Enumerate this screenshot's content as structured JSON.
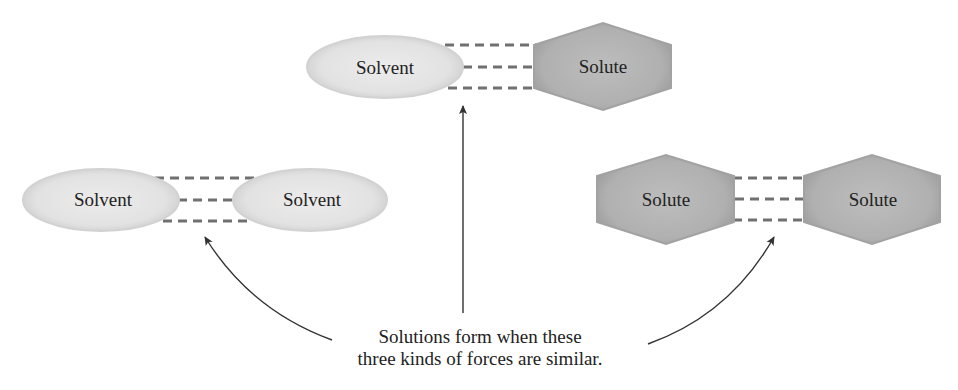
{
  "diagram": {
    "top_pair": {
      "left": {
        "shape": "ellipse",
        "label": "Solvent"
      },
      "right": {
        "shape": "hexagon",
        "label": "Solute"
      },
      "interaction": "dashed-lines x3"
    },
    "left_pair": {
      "left": {
        "shape": "ellipse",
        "label": "Solvent"
      },
      "right": {
        "shape": "ellipse",
        "label": "Solvent"
      },
      "interaction": "dashed-lines x3"
    },
    "right_pair": {
      "left": {
        "shape": "hexagon",
        "label": "Solute"
      },
      "right": {
        "shape": "hexagon",
        "label": "Solute"
      },
      "interaction": "dashed-lines x3"
    },
    "caption": {
      "line1": "Solutions form when these",
      "line2": "three kinds of forces are similar."
    },
    "arrows": [
      "caption-to-left-pair",
      "caption-to-top-pair",
      "caption-to-right-pair"
    ]
  },
  "colors": {
    "solvent_fill": "#e6e6e6",
    "solvent_edge": "#c8c8c8",
    "solute_fill": "#b4b4b4",
    "solute_edge": "#9a9a9a",
    "dash": "#707070",
    "arrow": "#333333",
    "text": "#222222"
  }
}
